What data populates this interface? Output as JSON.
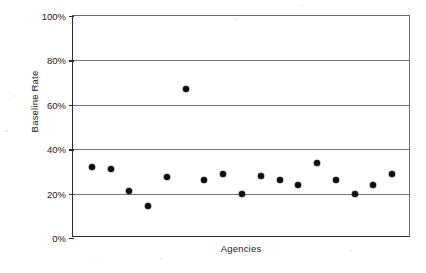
{
  "chart_data": {
    "type": "scatter",
    "title": "",
    "xlabel": "Agencies",
    "ylabel": "Baseline Rate",
    "ylim": [
      0,
      100
    ],
    "xlim": [
      0,
      18
    ],
    "grid": true,
    "legend": false,
    "ytick_labels": [
      "100%",
      "80%",
      "60%",
      "40%",
      "20%",
      "0%"
    ],
    "ytick_values": [
      100,
      80,
      60,
      40,
      20,
      0
    ],
    "xtick_labels": [],
    "series": [
      {
        "name": "Baseline Rate",
        "marker": "diamond",
        "color": "#0d0d0d",
        "x": [
          1,
          2,
          3,
          4,
          5,
          6,
          7,
          8,
          9,
          10,
          11,
          12,
          13,
          14,
          15,
          16,
          17
        ],
        "values": [
          32,
          31,
          21,
          14.5,
          27.5,
          67,
          26,
          29,
          20,
          28,
          26,
          24,
          34,
          26,
          20,
          24,
          29
        ]
      }
    ]
  },
  "axes": {
    "y_title": "Baseline Rate",
    "x_title": "Agencies"
  },
  "colors": {
    "marker": "#0d0d0d",
    "gridline": "#767676",
    "axis": "#2b2b2b",
    "background": "#ffffff"
  }
}
